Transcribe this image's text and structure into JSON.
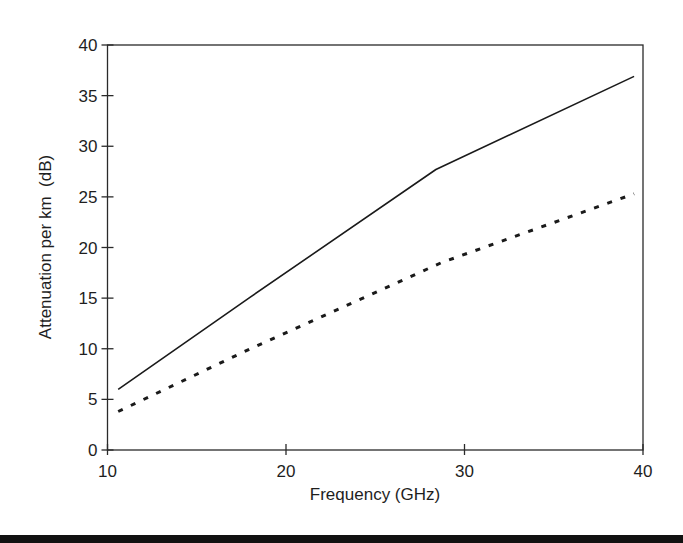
{
  "chart_data": {
    "type": "line",
    "title": "",
    "xlabel": "Frequency (GHz)",
    "ylabel": "Attenuation per km  (dB)",
    "xlim": [
      10,
      40
    ],
    "ylim": [
      0,
      40
    ],
    "xticks": [
      10,
      20,
      30,
      40
    ],
    "yticks": [
      0,
      5,
      10,
      15,
      20,
      25,
      30,
      35,
      40
    ],
    "grid": false,
    "legend": null,
    "series": [
      {
        "name": "solid",
        "style": "solid",
        "x": [
          10.6,
          18.0,
          28.4,
          39.5
        ],
        "y": [
          6.0,
          15.1,
          27.7,
          36.9
        ]
      },
      {
        "name": "dotted",
        "style": "dotted",
        "x": [
          10.6,
          18.0,
          28.7,
          39.5
        ],
        "y": [
          3.8,
          10.0,
          18.5,
          25.3
        ]
      }
    ]
  },
  "colors": {
    "axis": "#2a2a2a",
    "line": "#1a1a1a",
    "background": "#ffffff",
    "bottom_rule": "#111111"
  }
}
